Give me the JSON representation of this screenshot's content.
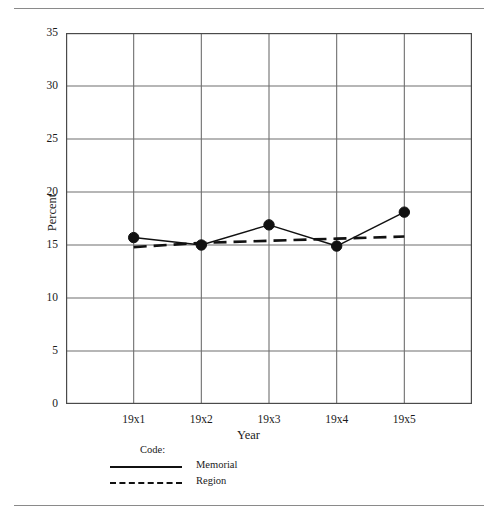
{
  "chart_data": {
    "type": "line",
    "title": "",
    "xlabel": "Year",
    "ylabel": "Percent",
    "categories": [
      "19x1",
      "19x2",
      "19x3",
      "19x4",
      "19x5"
    ],
    "ylim": [
      0,
      35
    ],
    "yticks": [
      0,
      5,
      10,
      15,
      20,
      25,
      30,
      35
    ],
    "ytick_labels": [
      "0",
      "5",
      "10",
      "15",
      "20",
      "25",
      "30",
      "35"
    ],
    "grid": true,
    "legend_position": "below-axes-left",
    "legend_title": "Code:",
    "series": [
      {
        "name": "Memorial",
        "style": "solid",
        "markers": "filled-circle",
        "values": [
          15.7,
          15.0,
          16.9,
          14.9,
          18.1
        ]
      },
      {
        "name": "Region",
        "style": "dashed",
        "markers": "none",
        "values": [
          14.8,
          15.2,
          15.4,
          15.6,
          15.8
        ]
      }
    ]
  },
  "axes": {
    "ylabel": "Percent",
    "xlabel": "Year"
  },
  "legend": {
    "title": "Code:",
    "entries": [
      {
        "label": "Memorial"
      },
      {
        "label": "Region"
      }
    ]
  },
  "colors": {
    "line": "#111111",
    "grid": "#6f6f6f",
    "frame": "#4a4a4a",
    "rule": "#8a8a8a",
    "text": "#1a1a1a",
    "background": "#ffffff"
  }
}
